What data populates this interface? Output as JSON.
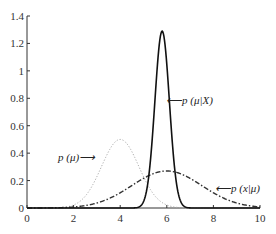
{
  "chart_data": {
    "type": "line",
    "title": "",
    "xlabel": "",
    "ylabel": "",
    "xlim": [
      0,
      10
    ],
    "ylim": [
      0,
      1.4
    ],
    "grid": false,
    "x_ticks": [
      "0",
      "2",
      "4",
      "6",
      "8",
      "10"
    ],
    "y_ticks": [
      "0",
      "0.2",
      "0.4",
      "0.6",
      "0.8",
      "1",
      "1.2",
      "1.4"
    ],
    "series": [
      {
        "name": "p(μ)",
        "style": "dotted",
        "color": "#aaaaaa",
        "distribution": "normal",
        "mean": 4.0,
        "std": 0.8,
        "peak": 0.5
      },
      {
        "name": "p(x|μ)",
        "style": "dash-dot",
        "color": "#333333",
        "distribution": "normal",
        "mean": 6.0,
        "std": 1.5,
        "peak": 0.27
      },
      {
        "name": "p(μ|X)",
        "style": "solid",
        "color": "#111111",
        "distribution": "normal",
        "mean": 5.8,
        "std": 0.31,
        "peak": 1.29
      }
    ],
    "annotations": [
      {
        "text": "p (μ)⟶",
        "target": "p(μ)"
      },
      {
        "text": "⟵p (μ|X)",
        "target": "p(μ|X)"
      },
      {
        "text": "⟵p (x|μ)",
        "target": "p(x|μ)"
      }
    ]
  }
}
